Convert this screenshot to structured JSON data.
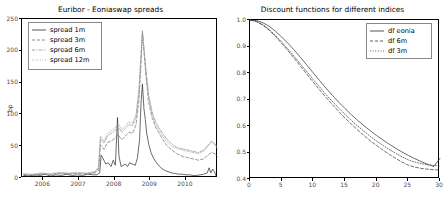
{
  "figure": {
    "background": "#ffffff",
    "axis_color": "#000000",
    "tick_label_color": "#4d4d4d"
  },
  "chart_data": [
    {
      "type": "line",
      "id": "euribor-eoniaswap-spreads",
      "title": "Euribor - Eoniaswap spreads",
      "xlabel": "",
      "ylabel": "bp",
      "xlim": [
        2005.4,
        2010.9
      ],
      "ylim": [
        0,
        250
      ],
      "xticks": [
        2006,
        2007,
        2008,
        2009,
        2010
      ],
      "xtick_labels": [
        "2006",
        "2007",
        "2008",
        "2009",
        "2010"
      ],
      "yticks": [
        0,
        50,
        100,
        150,
        200,
        250
      ],
      "ytick_labels": [
        "0",
        "50",
        "100",
        "150",
        "200",
        "250"
      ],
      "grid": false,
      "legend_position": "upper left",
      "series": [
        {
          "name": "spread 1m",
          "linestyle": "solid",
          "color": "#2b2b2b",
          "x": [
            2005.45,
            2005.6,
            2005.75,
            2005.9,
            2006.05,
            2006.2,
            2006.35,
            2006.5,
            2006.65,
            2006.8,
            2006.95,
            2007.1,
            2007.25,
            2007.4,
            2007.5,
            2007.58,
            2007.62,
            2007.68,
            2007.75,
            2007.82,
            2007.9,
            2007.96,
            2008.02,
            2008.08,
            2008.12,
            2008.18,
            2008.24,
            2008.3,
            2008.36,
            2008.42,
            2008.5,
            2008.58,
            2008.64,
            2008.7,
            2008.74,
            2008.78,
            2008.82,
            2008.86,
            2008.9,
            2008.96,
            2009.02,
            2009.1,
            2009.2,
            2009.3,
            2009.4,
            2009.5,
            2009.6,
            2009.7,
            2009.8,
            2009.9,
            2010.0,
            2010.1,
            2010.2,
            2010.3,
            2010.4,
            2010.5,
            2010.6,
            2010.65,
            2010.7,
            2010.75,
            2010.8,
            2010.85
          ],
          "y": [
            4,
            3,
            5,
            4,
            6,
            3,
            5,
            4,
            6,
            4,
            5,
            4,
            6,
            5,
            5,
            8,
            36,
            30,
            22,
            24,
            18,
            28,
            20,
            95,
            35,
            18,
            20,
            22,
            18,
            24,
            22,
            20,
            32,
            60,
            118,
            148,
            110,
            92,
            70,
            52,
            40,
            30,
            22,
            16,
            12,
            10,
            8,
            7,
            6,
            6,
            5,
            5,
            4,
            4,
            5,
            6,
            8,
            16,
            8,
            14,
            10,
            3
          ]
        },
        {
          "name": "spread 3m",
          "linestyle": "dashed",
          "color": "#6e6e6e",
          "x": [
            2005.45,
            2005.7,
            2005.95,
            2006.2,
            2006.45,
            2006.7,
            2006.95,
            2007.2,
            2007.45,
            2007.55,
            2007.6,
            2007.7,
            2007.8,
            2007.9,
            2008.0,
            2008.1,
            2008.2,
            2008.3,
            2008.4,
            2008.5,
            2008.6,
            2008.68,
            2008.74,
            2008.78,
            2008.82,
            2008.88,
            2008.95,
            2009.05,
            2009.15,
            2009.3,
            2009.45,
            2009.6,
            2009.75,
            2009.9,
            2010.05,
            2010.2,
            2010.35,
            2010.5,
            2010.62,
            2010.72,
            2010.82,
            2010.88
          ],
          "y": [
            5,
            4,
            6,
            5,
            7,
            6,
            7,
            6,
            8,
            12,
            52,
            45,
            56,
            58,
            62,
            68,
            60,
            66,
            72,
            70,
            84,
            122,
            180,
            228,
            200,
            160,
            120,
            95,
            80,
            65,
            52,
            44,
            38,
            34,
            32,
            30,
            28,
            30,
            36,
            40,
            38,
            34
          ]
        },
        {
          "name": "spread 6m",
          "linestyle": "dashdot",
          "color": "#8a8a8a",
          "x": [
            2005.45,
            2005.7,
            2005.95,
            2006.2,
            2006.45,
            2006.7,
            2006.95,
            2007.2,
            2007.45,
            2007.55,
            2007.6,
            2007.7,
            2007.8,
            2007.9,
            2008.0,
            2008.1,
            2008.2,
            2008.3,
            2008.4,
            2008.5,
            2008.6,
            2008.68,
            2008.74,
            2008.78,
            2008.82,
            2008.88,
            2008.95,
            2009.05,
            2009.15,
            2009.3,
            2009.45,
            2009.6,
            2009.75,
            2009.9,
            2010.05,
            2010.2,
            2010.35,
            2010.5,
            2010.62,
            2010.72,
            2010.82,
            2010.88
          ],
          "y": [
            6,
            5,
            7,
            6,
            8,
            7,
            8,
            7,
            9,
            16,
            62,
            55,
            66,
            70,
            74,
            80,
            72,
            78,
            84,
            82,
            96,
            134,
            192,
            232,
            206,
            170,
            132,
            104,
            88,
            74,
            62,
            54,
            48,
            46,
            44,
            42,
            40,
            44,
            52,
            58,
            54,
            48
          ]
        },
        {
          "name": "spread 12m",
          "linestyle": "dotted",
          "color": "#a0a0a0",
          "x": [
            2005.45,
            2005.7,
            2005.95,
            2006.2,
            2006.45,
            2006.7,
            2006.95,
            2007.2,
            2007.45,
            2007.55,
            2007.6,
            2007.7,
            2007.8,
            2007.9,
            2008.0,
            2008.1,
            2008.2,
            2008.3,
            2008.4,
            2008.5,
            2008.6,
            2008.68,
            2008.74,
            2008.78,
            2008.82,
            2008.88,
            2008.95,
            2009.05,
            2009.15,
            2009.3,
            2009.45,
            2009.6,
            2009.75,
            2009.9,
            2010.05,
            2010.2,
            2010.35,
            2010.5,
            2010.62,
            2010.72,
            2010.82,
            2010.88
          ],
          "y": [
            7,
            6,
            8,
            7,
            9,
            8,
            9,
            8,
            10,
            18,
            66,
            58,
            70,
            74,
            78,
            86,
            76,
            82,
            88,
            86,
            100,
            140,
            196,
            230,
            204,
            166,
            128,
            100,
            84,
            70,
            58,
            50,
            46,
            44,
            42,
            40,
            38,
            42,
            50,
            56,
            52,
            46
          ]
        }
      ]
    },
    {
      "type": "line",
      "id": "discount-functions",
      "title": "Discount functions for different indices",
      "xlabel": "",
      "ylabel": "",
      "xlim": [
        0,
        30
      ],
      "ylim": [
        0.4,
        1.0
      ],
      "xticks": [
        0,
        5,
        10,
        15,
        20,
        25,
        30
      ],
      "xtick_labels": [
        "0",
        "5",
        "10",
        "15",
        "20",
        "25",
        "30"
      ],
      "yticks": [
        0.4,
        0.5,
        0.6,
        0.7,
        0.8,
        0.9,
        1.0
      ],
      "ytick_labels": [
        "0.4",
        "0.5",
        "0.6",
        "0.7",
        "0.8",
        "0.9",
        "1.0"
      ],
      "grid": false,
      "legend_position": "upper right",
      "series": [
        {
          "name": "df eonia",
          "linestyle": "solid",
          "color": "#2b2b2b",
          "x": [
            0,
            1,
            2,
            3,
            4,
            5,
            6,
            7,
            8,
            9,
            10,
            11,
            12,
            13,
            14,
            15,
            16,
            17,
            18,
            19,
            20,
            21,
            22,
            23,
            24,
            25,
            26,
            27,
            28,
            29,
            30
          ],
          "y": [
            1.0,
            0.998,
            0.99,
            0.977,
            0.958,
            0.936,
            0.912,
            0.886,
            0.858,
            0.829,
            0.8,
            0.771,
            0.743,
            0.716,
            0.69,
            0.666,
            0.643,
            0.621,
            0.601,
            0.582,
            0.564,
            0.547,
            0.531,
            0.516,
            0.502,
            0.489,
            0.477,
            0.466,
            0.456,
            0.447,
            0.478
          ]
        },
        {
          "name": "df 6m",
          "linestyle": "dashed",
          "color": "#333333",
          "x": [
            0,
            1,
            2,
            3,
            4,
            5,
            6,
            7,
            8,
            9,
            10,
            11,
            12,
            13,
            14,
            15,
            16,
            17,
            18,
            19,
            20,
            21,
            22,
            23,
            24,
            25,
            26,
            27,
            28,
            29,
            30
          ],
          "y": [
            1.0,
            0.994,
            0.981,
            0.962,
            0.938,
            0.912,
            0.884,
            0.855,
            0.825,
            0.795,
            0.765,
            0.736,
            0.708,
            0.681,
            0.655,
            0.63,
            0.607,
            0.585,
            0.564,
            0.544,
            0.526,
            0.509,
            0.493,
            0.478,
            0.464,
            0.452,
            0.445,
            0.44,
            0.437,
            0.435,
            0.434
          ]
        },
        {
          "name": "df 3m",
          "linestyle": "dotted",
          "color": "#333333",
          "x": [
            0,
            1,
            2,
            3,
            4,
            5,
            6,
            7,
            8,
            9,
            10,
            11,
            12,
            13,
            14,
            15,
            16,
            17,
            18,
            19,
            20,
            21,
            22,
            23,
            24,
            25,
            26,
            27,
            28,
            29,
            30
          ],
          "y": [
            1.0,
            0.995,
            0.983,
            0.965,
            0.942,
            0.917,
            0.89,
            0.862,
            0.833,
            0.804,
            0.775,
            0.747,
            0.719,
            0.693,
            0.668,
            0.644,
            0.621,
            0.6,
            0.58,
            0.561,
            0.543,
            0.527,
            0.511,
            0.497,
            0.484,
            0.472,
            0.464,
            0.458,
            0.454,
            0.451,
            0.449
          ]
        }
      ]
    }
  ]
}
